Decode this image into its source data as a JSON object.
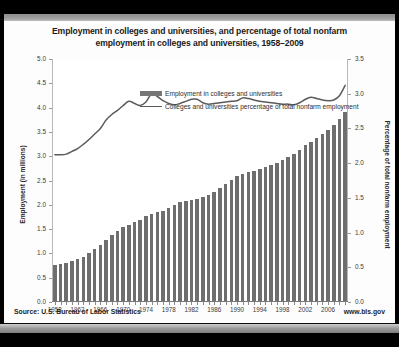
{
  "chart_data": {
    "type": "bar",
    "title": "Employment in colleges and universities, and percentage of total nonfarm employment in colleges and universities, 1958–2009",
    "title_line1": "Employment in colleges and universities, and percentage of total nonfarm",
    "title_line2": "employment in colleges and universities, 1958–2009",
    "xlabel": "",
    "ylabel": "Employment (in millions)",
    "y2label": "Percentage of total nonfarm employment",
    "ylim": [
      0.0,
      5.0
    ],
    "y2lim": [
      0.0,
      3.5
    ],
    "ytick_labels": [
      "0.0",
      "0.5",
      "1.0",
      "1.5",
      "2.0",
      "2.5",
      "3.0",
      "3.5",
      "4.0",
      "4.5",
      "5.0"
    ],
    "ytick_values": [
      0.0,
      0.5,
      1.0,
      1.5,
      2.0,
      2.5,
      3.0,
      3.5,
      4.0,
      4.5,
      5.0
    ],
    "y2tick_labels": [
      "0.0",
      "0.5",
      "1.0",
      "1.5",
      "2.0",
      "2.5",
      "3.0",
      "3.5"
    ],
    "y2tick_values": [
      0.0,
      0.5,
      1.0,
      1.5,
      2.0,
      2.5,
      3.0,
      3.5
    ],
    "xtick_labels": [
      "1958",
      "1962",
      "1966",
      "1970",
      "1974",
      "1978",
      "1982",
      "1986",
      "1990",
      "1994",
      "1998",
      "2002",
      "2006"
    ],
    "grid": false,
    "legend_position": "top-left",
    "legend": [
      {
        "name": "Employment in colleges and universities",
        "type": "bar",
        "color": "#6e6e6e"
      },
      {
        "name": "Colleges and universities percentage of total nonfarm employment",
        "type": "line",
        "color": "#5b5b5b"
      }
    ],
    "categories": [
      1958,
      1959,
      1960,
      1961,
      1962,
      1963,
      1964,
      1965,
      1966,
      1967,
      1968,
      1969,
      1970,
      1971,
      1972,
      1973,
      1974,
      1975,
      1976,
      1977,
      1978,
      1979,
      1980,
      1981,
      1982,
      1983,
      1984,
      1985,
      1986,
      1987,
      1988,
      1989,
      1990,
      1991,
      1992,
      1993,
      1994,
      1995,
      1996,
      1997,
      1998,
      1999,
      2000,
      2001,
      2002,
      2003,
      2004,
      2005,
      2006,
      2007,
      2008,
      2009
    ],
    "series": [
      {
        "name": "Employment in colleges and universities",
        "axis": "left",
        "units": "millions",
        "values": [
          0.74,
          0.76,
          0.79,
          0.82,
          0.86,
          0.91,
          0.98,
          1.06,
          1.16,
          1.26,
          1.36,
          1.45,
          1.52,
          1.57,
          1.62,
          1.67,
          1.74,
          1.8,
          1.83,
          1.86,
          1.92,
          1.98,
          2.03,
          2.06,
          2.08,
          2.1,
          2.14,
          2.19,
          2.25,
          2.33,
          2.41,
          2.49,
          2.57,
          2.62,
          2.65,
          2.68,
          2.72,
          2.76,
          2.8,
          2.85,
          2.9,
          2.96,
          3.02,
          3.1,
          3.2,
          3.28,
          3.36,
          3.43,
          3.52,
          3.62,
          3.74,
          3.88
        ]
      },
      {
        "name": "Colleges and universities percentage of total nonfarm employment",
        "axis": "right",
        "units": "percent",
        "values": [
          2.12,
          2.12,
          2.13,
          2.17,
          2.21,
          2.27,
          2.34,
          2.42,
          2.5,
          2.62,
          2.7,
          2.76,
          2.83,
          2.89,
          2.86,
          2.83,
          2.88,
          3.0,
          2.96,
          2.9,
          2.86,
          2.84,
          2.86,
          2.89,
          2.92,
          2.92,
          2.87,
          2.85,
          2.86,
          2.87,
          2.88,
          2.89,
          2.9,
          2.94,
          2.93,
          2.91,
          2.89,
          2.88,
          2.87,
          2.86,
          2.85,
          2.85,
          2.84,
          2.87,
          2.92,
          2.95,
          2.93,
          2.91,
          2.9,
          2.91,
          2.97,
          3.12
        ]
      }
    ]
  },
  "footer": {
    "source": "Source: U.S. Bureau of Labor Statistics",
    "url": "www.bls.gov"
  }
}
